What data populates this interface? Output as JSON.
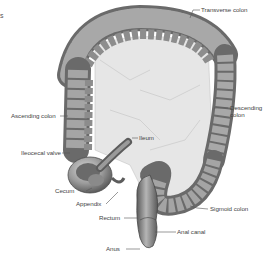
{
  "corner_fragment": "s",
  "colors": {
    "tissue_dark": "#6e6e6e",
    "tissue_mid": "#9a9a9a",
    "tissue_light": "#c9c9c9",
    "mesentery": "#e4e4e4",
    "label_text": "#444444",
    "leader_line": "#555555"
  },
  "labels": {
    "transverse_colon": "Transverse colon",
    "descending_colon_1": "Descending",
    "descending_colon_2": "colon",
    "ascending_colon": "Ascending colon",
    "ileum": "Ileum",
    "ileocecal_valve": "Ileocecal valve",
    "cecum": "Cecum",
    "appendix": "Appendix",
    "rectum": "Rectum",
    "sigmoid_colon": "Sigmoid colon",
    "anal_canal": "Anal canal",
    "anus": "Anus"
  }
}
